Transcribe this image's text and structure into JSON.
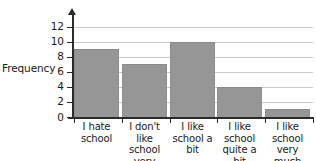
{
  "chart_data": {
    "type": "bar",
    "title": "",
    "xlabel": "",
    "ylabel": "Frequency",
    "categories": [
      "I hate school",
      "I don't like school very much",
      "I like school a bit",
      "I like school quite a bit",
      "I like school very much"
    ],
    "values": [
      9,
      7,
      10,
      4,
      1
    ],
    "ylim": [
      0,
      13
    ],
    "yticks": [
      0,
      2,
      4,
      6,
      8,
      10,
      12
    ],
    "ytick_labels": [
      "0",
      "2",
      "4",
      "6",
      "8",
      "10",
      "12"
    ],
    "grid": true,
    "grid_axis": "y",
    "legend": false,
    "bar_color": "#969696",
    "grid_color": "#c9c9c9",
    "axis_color": "#2b2b2b",
    "background": "#ffffff"
  }
}
